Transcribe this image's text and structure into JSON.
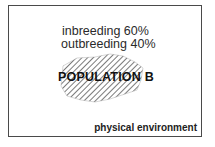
{
  "diagram": {
    "population": {
      "label": "POPULATION B",
      "inbreeding": "inbreeding 60%",
      "outbreeding": "outbreeding 40%",
      "fill_pattern": "diagonal-hatch"
    },
    "environment_label": "physical environment",
    "colors": {
      "frame": "#4a4a4a",
      "hatch": "#333333",
      "text": "#222222"
    }
  }
}
